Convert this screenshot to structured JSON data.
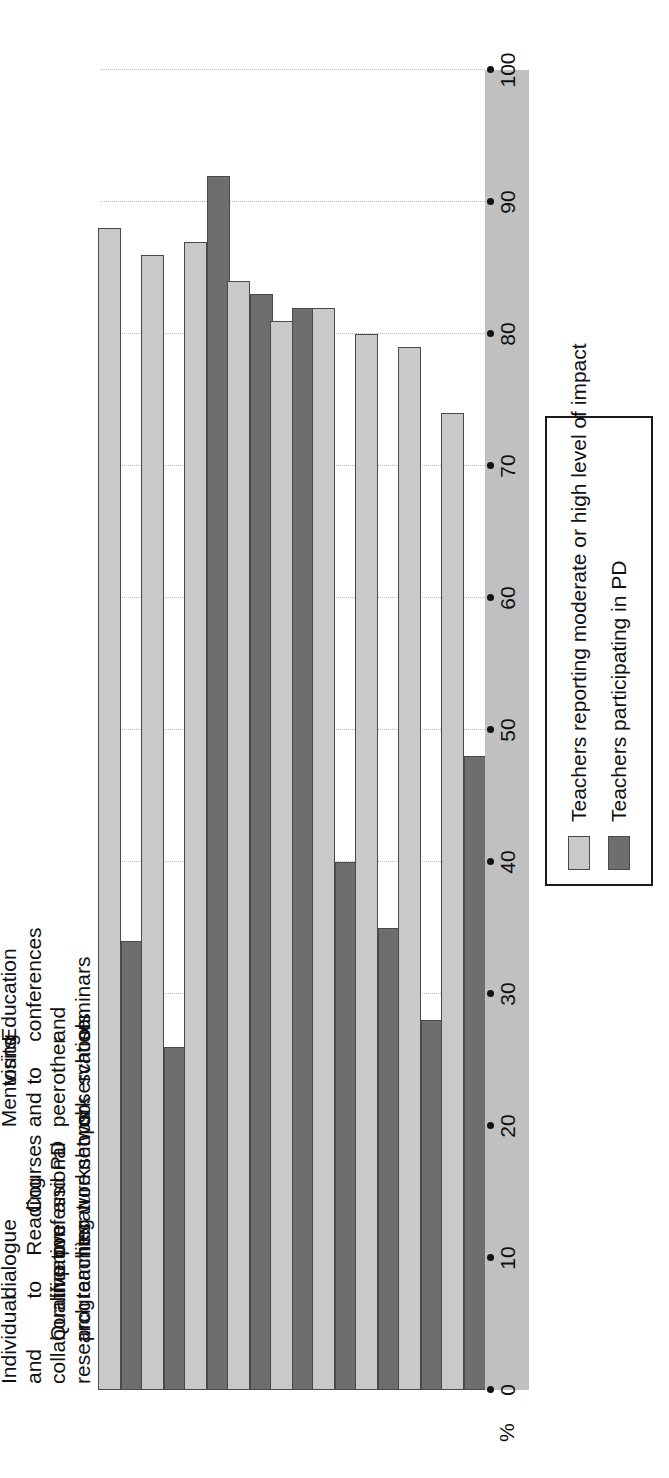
{
  "chart_data": {
    "type": "bar",
    "orientation": "horizontal",
    "title": "",
    "xlabel": "",
    "ylabel": "%",
    "axis_unit_label": "%",
    "ylim": [
      0,
      100
    ],
    "xlim": [
      0,
      100
    ],
    "value_axis_ticks": [
      100,
      90,
      80,
      70,
      60,
      50,
      40,
      30,
      20,
      10,
      0
    ],
    "grid": true,
    "legend_position": "top-left",
    "categories": [
      "Individual and collaborative research",
      "Qualification programmes",
      "Informal dialogue to improve teaching",
      "Reading professional literature",
      "Courses and workshops",
      "PD network",
      "Mentoring and peer observation",
      "Observation visits to other schools",
      "Education conferences and seminars"
    ],
    "category_lines": [
      [
        "Individual and",
        "collaborative",
        "research"
      ],
      [
        "Qualification",
        "programmes"
      ],
      [
        "Informal",
        "dialogue",
        "to improve",
        "teaching"
      ],
      [
        "Reading",
        "professional",
        "literature"
      ],
      [
        "Courses",
        "and",
        "workshops"
      ],
      [
        "PD",
        "network"
      ],
      [
        "Mentoring",
        "and peer",
        "observation"
      ],
      [
        "Observation",
        "visits to",
        "other schools"
      ],
      [
        "Education",
        "conferences",
        "and seminars"
      ]
    ],
    "series": [
      {
        "name": "Teachers reporting moderate or high level of impact",
        "color": "#c9c9c9",
        "values": [
          88,
          86,
          87,
          84,
          81,
          82,
          80,
          79,
          74
        ]
      },
      {
        "name": "Teachers participating in PD",
        "color": "#6e6e6e",
        "values": [
          34,
          26,
          92,
          83,
          82,
          40,
          35,
          28,
          48
        ]
      }
    ]
  },
  "legend": {
    "items": [
      {
        "label": "Teachers reporting moderate or high level of impact",
        "swatch": "light"
      },
      {
        "label": "Teachers participating in PD",
        "swatch": "dark"
      }
    ]
  },
  "colors": {
    "light_bar": "#c9c9c9",
    "dark_bar": "#6e6e6e",
    "axis_band": "#c0c0c0",
    "grid": "#b8b8b8",
    "axis_line": "#3a3a3a",
    "text": "#111111"
  }
}
